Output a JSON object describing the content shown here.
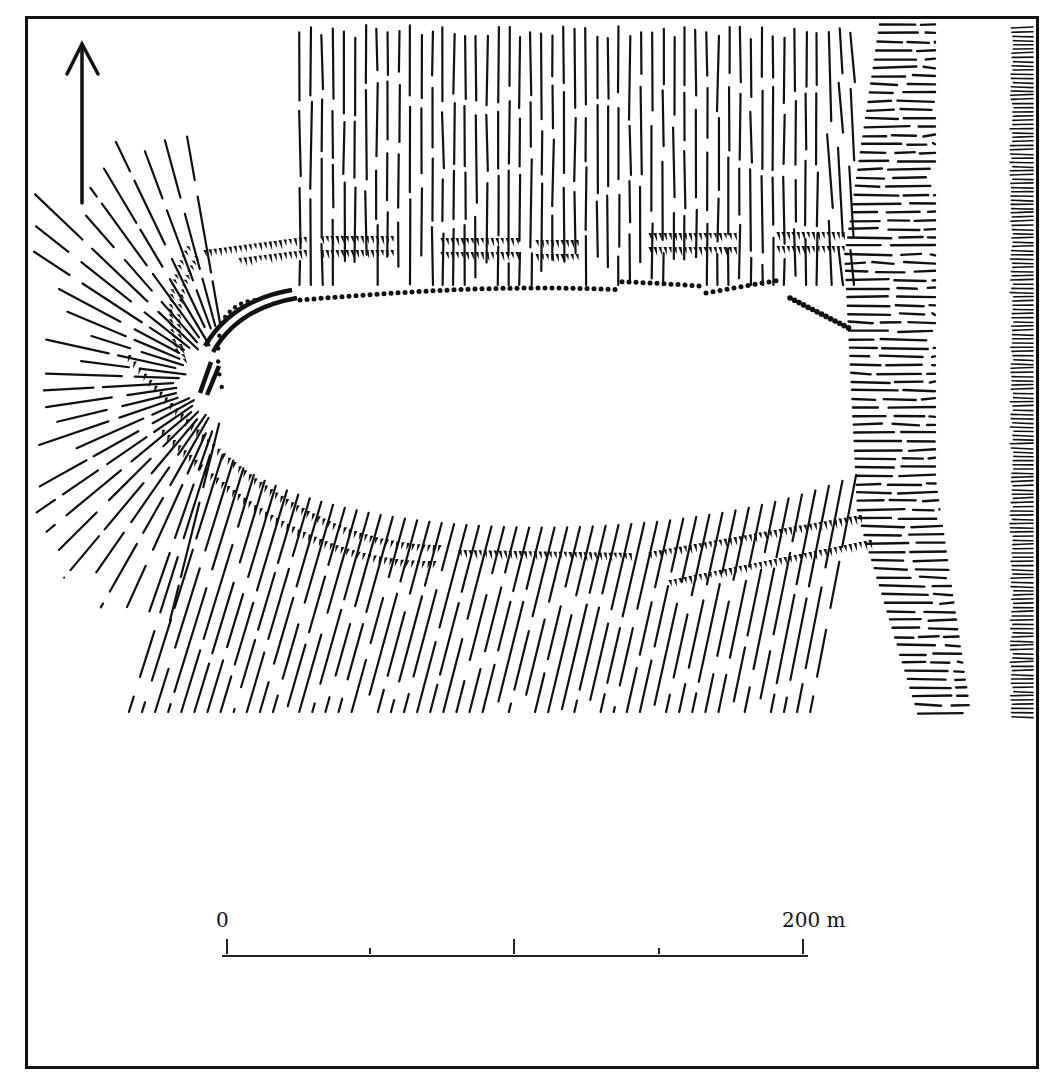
{
  "figure": {
    "type": "archaeological site plan (hillfort)",
    "north_arrow": {
      "direction": "north",
      "icon": "north-arrow-icon"
    },
    "scale_bar": {
      "start_label": "0",
      "end_label": "200 m",
      "ticks": [
        0,
        50,
        100,
        150,
        200
      ],
      "unit": "m"
    },
    "features": [
      {
        "name": "plateau",
        "shape": "oval, elongated east-west"
      },
      {
        "name": "rampart",
        "symbol": "dotted line around plateau edge"
      },
      {
        "name": "wall-segment",
        "symbol": "solid double line at western tip"
      },
      {
        "name": "slopes",
        "symbol": "hachures radiating from plateau"
      },
      {
        "name": "terraces",
        "symbol": "toothed hachure bands (north and south)"
      },
      {
        "name": "cliff",
        "symbol": "horizontal hachure band east"
      },
      {
        "name": "steep-edge",
        "symbol": "dense horizontal hachure at far east"
      }
    ],
    "colors": {
      "ink": "#111111",
      "paper": "#ffffff"
    }
  }
}
